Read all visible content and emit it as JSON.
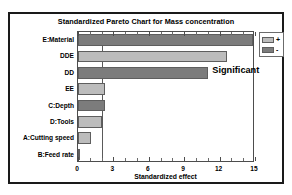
{
  "chart_data": {
    "type": "bar",
    "orientation": "horizontal",
    "title": "Standardized Pareto Chart for Mass concentration",
    "xlabel": "Standardized effect",
    "ylabel": "",
    "xlim": [
      0,
      15
    ],
    "xticks": [
      0,
      3,
      6,
      9,
      12,
      15
    ],
    "xtick_labels": [
      "0",
      "3",
      "6",
      "9",
      "12",
      "15"
    ],
    "grid": false,
    "categories": [
      "E:Material",
      "DDE",
      "DD",
      "EE",
      "C:Depth",
      "D:Tools",
      "A:Cutting speed",
      "B:Feed rate"
    ],
    "values": [
      14.8,
      12.6,
      11.0,
      2.3,
      2.3,
      2.0,
      1.1,
      0.15
    ],
    "signs": [
      "-",
      "+",
      "-",
      "+",
      "-",
      "+",
      "+",
      "+"
    ],
    "threshold": 2.0,
    "annotations": [
      {
        "text": "Significant",
        "x": 11.3,
        "category": "DD"
      }
    ],
    "legend": {
      "position": "right-outside",
      "entries": [
        {
          "label": "+",
          "sign": "+",
          "color": "#bcbcbc"
        },
        {
          "label": "-",
          "sign": "-",
          "color": "#7c7c7c"
        }
      ]
    },
    "colors": {
      "positive": "#bcbcbc",
      "negative": "#7c7c7c",
      "bar_border": "#5e5e5e",
      "axis": "#4d4d4d",
      "threshold_line": "#5a5a5a",
      "frame": "#1a1a1a",
      "text": "#000000",
      "background": "#ffffff"
    }
  }
}
